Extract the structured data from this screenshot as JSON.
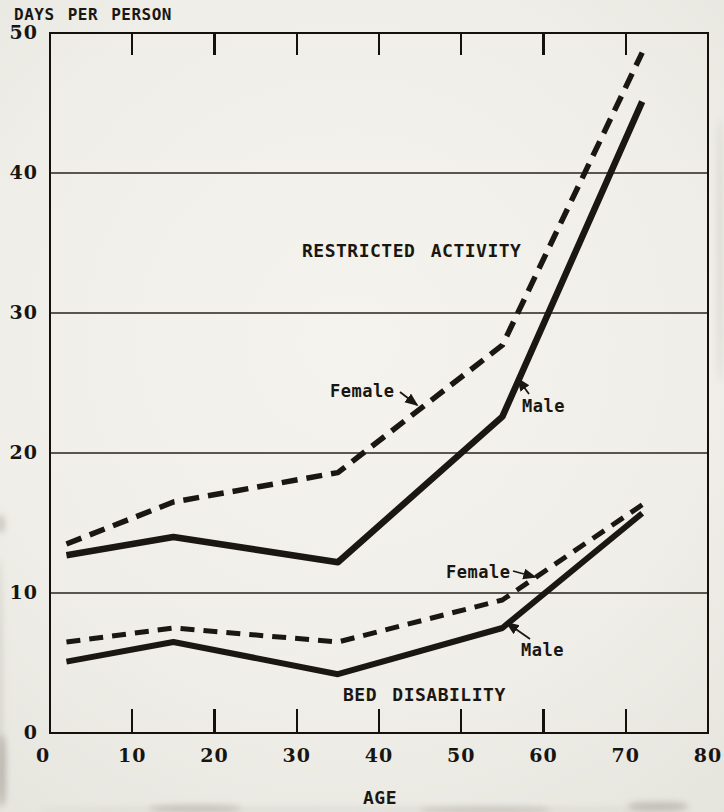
{
  "chart_data": {
    "type": "line",
    "title": "",
    "xlabel": "AGE",
    "ylabel": "DAYS PER PERSON",
    "xlim": [
      0,
      80
    ],
    "ylim": [
      0,
      50
    ],
    "x_ticks": [
      0,
      10,
      20,
      30,
      40,
      50,
      60,
      70,
      80
    ],
    "x_ticks_inner": [
      10,
      20,
      30,
      40,
      50,
      60,
      70
    ],
    "y_ticks": [
      0,
      10,
      20,
      30,
      40,
      50
    ],
    "y_gridlines": [
      10,
      20,
      30,
      40
    ],
    "grid": "horizontal gridlines at 10,20,30,40; full plot box border; ticks inside top and bottom edges",
    "legend_position": "inline annotations with arrows",
    "x": [
      2,
      15,
      35,
      55,
      72
    ],
    "series": [
      {
        "id": "restricted-female",
        "group": "RESTRICTED ACTIVITY",
        "group_key": "restricted",
        "label": "Female",
        "style": "dashed",
        "values": [
          13.5,
          16.5,
          18.6,
          27.7,
          48.6
        ]
      },
      {
        "id": "restricted-male",
        "group": "RESTRICTED ACTIVITY",
        "group_key": "restricted",
        "label": "Male",
        "style": "solid",
        "values": [
          12.7,
          14.0,
          12.2,
          22.6,
          45.1
        ]
      },
      {
        "id": "bed-female",
        "group": "BED DISABILITY",
        "group_key": "bed",
        "label": "Female",
        "style": "dashed",
        "values": [
          6.5,
          7.5,
          6.5,
          9.5,
          16.3
        ]
      },
      {
        "id": "bed-male",
        "group": "BED DISABILITY",
        "group_key": "bed",
        "label": "Male",
        "style": "solid",
        "values": [
          5.1,
          6.5,
          4.2,
          7.5,
          15.7
        ]
      }
    ],
    "annotations": {
      "restricted_title": "RESTRICTED ACTIVITY",
      "restricted_female_label": "Female",
      "restricted_male_label": "Male",
      "bed_title": "BED DISABILITY",
      "bed_female_label": "Female",
      "bed_male_label": "Male"
    },
    "ink_color": "#1a1712",
    "paper_color": "#f1f0ea"
  }
}
